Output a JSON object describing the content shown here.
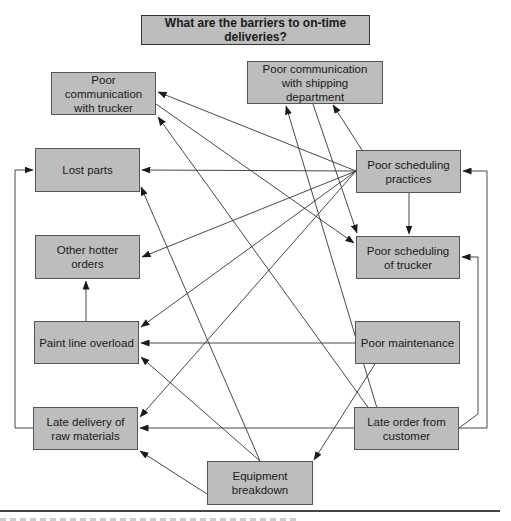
{
  "diagram": {
    "type": "interrelationship-digraph",
    "title": "What are the barriers to on-time deliveries?",
    "nodes": [
      {
        "id": "pct",
        "label": "Poor communication with trucker"
      },
      {
        "id": "pcs",
        "label": "Poor communication with shipping department"
      },
      {
        "id": "lp",
        "label": "Lost parts"
      },
      {
        "id": "oho",
        "label": "Other hotter orders"
      },
      {
        "id": "plo",
        "label": "Paint line overload"
      },
      {
        "id": "ldr",
        "label": "Late delivery of raw materials"
      },
      {
        "id": "psp",
        "label": "Poor scheduling practices"
      },
      {
        "id": "pst",
        "label": "Poor scheduling of trucker"
      },
      {
        "id": "pm",
        "label": "Poor maintenance"
      },
      {
        "id": "loc",
        "label": "Late order from customer"
      },
      {
        "id": "eb",
        "label": "Equipment breakdown"
      }
    ],
    "edges": [
      {
        "from": "psp",
        "to": "pct"
      },
      {
        "from": "psp",
        "to": "pcs"
      },
      {
        "from": "psp",
        "to": "lp"
      },
      {
        "from": "psp",
        "to": "oho"
      },
      {
        "from": "psp",
        "to": "plo"
      },
      {
        "from": "psp",
        "to": "ldr"
      },
      {
        "from": "psp",
        "to": "pst"
      },
      {
        "from": "pct",
        "to": "pst"
      },
      {
        "from": "pcs",
        "to": "pst"
      },
      {
        "from": "loc",
        "to": "pct"
      },
      {
        "from": "loc",
        "to": "pcs"
      },
      {
        "from": "loc",
        "to": "psp"
      },
      {
        "from": "loc",
        "to": "pst"
      },
      {
        "from": "loc",
        "to": "ldr"
      },
      {
        "from": "plo",
        "to": "oho"
      },
      {
        "from": "pm",
        "to": "plo"
      },
      {
        "from": "pm",
        "to": "eb"
      },
      {
        "from": "eb",
        "to": "lp"
      },
      {
        "from": "eb",
        "to": "plo"
      },
      {
        "from": "eb",
        "to": "ldr"
      },
      {
        "from": "ldr",
        "to": "lp"
      }
    ]
  },
  "colors": {
    "box_fill": "#bdbdbd",
    "box_border": "#555555",
    "line": "#333333",
    "background": "#ffffff"
  }
}
